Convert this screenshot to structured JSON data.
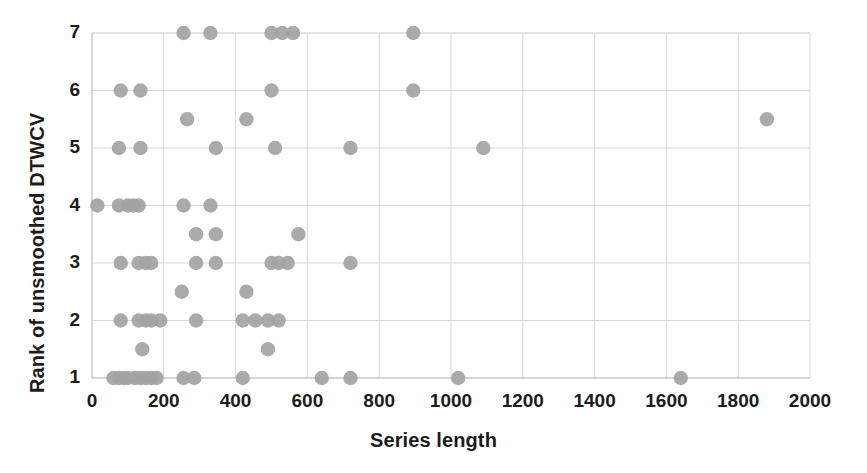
{
  "chart_data": {
    "type": "scatter",
    "title": "",
    "xlabel": "Series length",
    "ylabel": "Rank of unsmoothed DTWCV",
    "xlim": [
      0,
      2000
    ],
    "ylim": [
      1,
      7
    ],
    "xticks": [
      0,
      200,
      400,
      600,
      800,
      1000,
      1200,
      1400,
      1600,
      1800,
      2000
    ],
    "yticks": [
      1,
      2,
      3,
      4,
      5,
      6,
      7
    ],
    "xtick_labels": [
      "0",
      "200",
      "400",
      "600",
      "800",
      "1000",
      "1200",
      "1400",
      "1600",
      "1800",
      "2000"
    ],
    "ytick_labels": [
      "1",
      "2",
      "3",
      "4",
      "5",
      "6",
      "7"
    ],
    "grid": true,
    "legend": false,
    "marker_color": "#a3a3a3",
    "gridline_color": "#d9d9d9",
    "points": [
      [
        255,
        7
      ],
      [
        330,
        7
      ],
      [
        500,
        7
      ],
      [
        530,
        7
      ],
      [
        560,
        7
      ],
      [
        895,
        7
      ],
      [
        80,
        6
      ],
      [
        135,
        6
      ],
      [
        500,
        6
      ],
      [
        895,
        6
      ],
      [
        265,
        5.5
      ],
      [
        430,
        5.5
      ],
      [
        1880,
        5.5
      ],
      [
        75,
        5
      ],
      [
        135,
        5
      ],
      [
        345,
        5
      ],
      [
        510,
        5
      ],
      [
        720,
        5
      ],
      [
        1090,
        5
      ],
      [
        15,
        4
      ],
      [
        75,
        4
      ],
      [
        100,
        4
      ],
      [
        115,
        4
      ],
      [
        130,
        4
      ],
      [
        255,
        4
      ],
      [
        330,
        4
      ],
      [
        290,
        3.5
      ],
      [
        345,
        3.5
      ],
      [
        575,
        3.5
      ],
      [
        80,
        3
      ],
      [
        130,
        3
      ],
      [
        150,
        3
      ],
      [
        165,
        3
      ],
      [
        290,
        3
      ],
      [
        345,
        3
      ],
      [
        500,
        3
      ],
      [
        520,
        3
      ],
      [
        545,
        3
      ],
      [
        720,
        3
      ],
      [
        250,
        2.5
      ],
      [
        430,
        2.5
      ],
      [
        80,
        2
      ],
      [
        130,
        2
      ],
      [
        150,
        2
      ],
      [
        165,
        2
      ],
      [
        190,
        2
      ],
      [
        290,
        2
      ],
      [
        420,
        2
      ],
      [
        455,
        2
      ],
      [
        490,
        2
      ],
      [
        520,
        2
      ],
      [
        140,
        1.5
      ],
      [
        490,
        1.5
      ],
      [
        60,
        1
      ],
      [
        75,
        1
      ],
      [
        90,
        1
      ],
      [
        100,
        1
      ],
      [
        120,
        1
      ],
      [
        135,
        1
      ],
      [
        150,
        1
      ],
      [
        165,
        1
      ],
      [
        180,
        1
      ],
      [
        255,
        1
      ],
      [
        285,
        1
      ],
      [
        420,
        1
      ],
      [
        640,
        1
      ],
      [
        720,
        1
      ],
      [
        1020,
        1
      ],
      [
        1640,
        1
      ]
    ]
  }
}
